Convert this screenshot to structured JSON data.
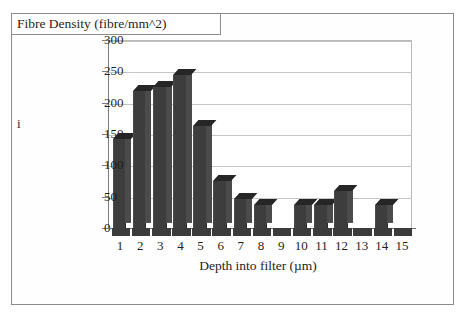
{
  "figure": {
    "title_box_label": "Fibre Density (fibre/mm^2)",
    "margin_glyph": "i",
    "x_axis_title": "Depth into filter (µm)",
    "bar_color": "#3d3d3d",
    "bar_side_color": "#4b4b4b",
    "bar_top_color": "#262626",
    "gridline_color": "#c5c5c5",
    "frame_color": "#8c8c8c",
    "background": "#ffffff"
  },
  "chart_data": {
    "type": "bar",
    "title": "Fibre Density (fibre/mm^2)",
    "xlabel": "Depth into filter (µm)",
    "ylabel": "Fibre Density (fibre/mm^2)",
    "categories": [
      "1",
      "2",
      "3",
      "4",
      "5",
      "6",
      "7",
      "8",
      "9",
      "10",
      "11",
      "12",
      "13",
      "14",
      "15"
    ],
    "values": [
      144,
      220,
      227,
      245,
      165,
      77,
      48,
      38,
      0,
      38,
      38,
      60,
      0,
      38,
      0
    ],
    "ylim": [
      0,
      300
    ],
    "yticks": [
      0,
      50,
      100,
      150,
      200,
      250,
      300
    ],
    "ytick_labels": [
      "0",
      "50",
      "100",
      "150",
      "200",
      "250",
      "300"
    ],
    "grid": true,
    "legend": false,
    "style": "3d-column"
  }
}
